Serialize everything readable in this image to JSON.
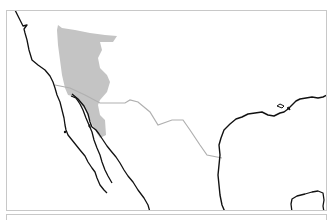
{
  "map": {
    "type": "species-range-map",
    "region": "southwestern United States and northwestern Mexico",
    "colors": {
      "background": "#ffffff",
      "range_fill": "#c4c4c4",
      "coastline": "#111111",
      "border": "#b0b0b0",
      "frame": "#c8c8c8"
    },
    "layers": [
      "coastline",
      "international-border",
      "range-area"
    ]
  }
}
